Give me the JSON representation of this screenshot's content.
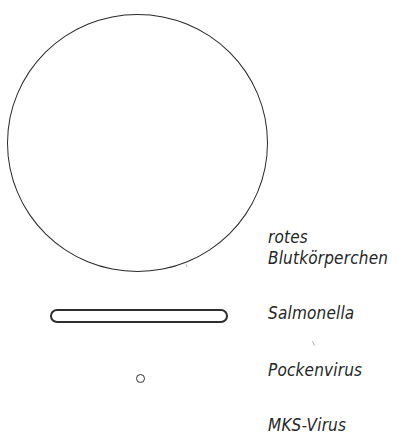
{
  "figure": {
    "items": [
      {
        "id": "red-blood-cell",
        "shape": "large-circle",
        "label_lines": [
          "rotes",
          "Blutkörperchen"
        ]
      },
      {
        "id": "salmonella",
        "shape": "rod",
        "label": "Salmonella"
      },
      {
        "id": "pox-virus",
        "shape": "small-circle",
        "label": "Pockenvirus"
      },
      {
        "id": "fmd-virus",
        "shape": "not-visible (below cut)",
        "label": "MKS-Virus"
      }
    ],
    "colors": {
      "line": "#2a2a2a",
      "text": "#262626",
      "background": "#ffffff"
    }
  }
}
